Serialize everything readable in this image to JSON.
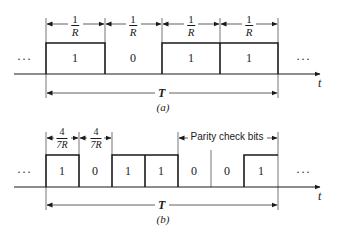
{
  "diagram": {
    "colors": {
      "line": "#1a1a1a",
      "background": "#ffffff"
    },
    "panel_a": {
      "caption": "(a)",
      "ellipsis_left": "···",
      "ellipsis_right": "···",
      "axis_label": "t",
      "period_label": "T",
      "bits": [
        {
          "value": "1",
          "duration_num": "1",
          "duration_den": "R"
        },
        {
          "value": "0",
          "duration_num": "1",
          "duration_den": "R"
        },
        {
          "value": "1",
          "duration_num": "1",
          "duration_den": "R"
        },
        {
          "value": "1",
          "duration_num": "1",
          "duration_den": "R"
        }
      ]
    },
    "panel_b": {
      "caption": "(b)",
      "ellipsis_left": "···",
      "ellipsis_right": "···",
      "axis_label": "t",
      "period_label": "T",
      "parity_label": "Parity check bits",
      "bits": [
        {
          "value": "1",
          "duration_num": "4",
          "duration_den": "7R"
        },
        {
          "value": "0",
          "duration_num": "4",
          "duration_den": "7R"
        },
        {
          "value": "1"
        },
        {
          "value": "1"
        },
        {
          "value": "0"
        },
        {
          "value": "0"
        },
        {
          "value": "1"
        }
      ]
    }
  }
}
